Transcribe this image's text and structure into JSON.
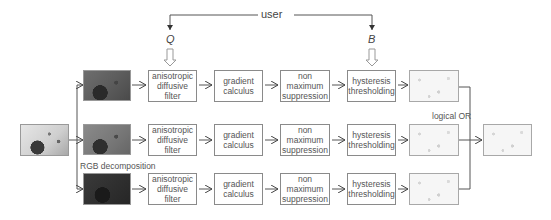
{
  "diagram": {
    "user_label": "user",
    "params": {
      "q": "Q",
      "b": "B"
    },
    "rgb_label": "RGB decomposition",
    "or_label": "logical OR",
    "rows": [
      {
        "channel": "red",
        "steps": [
          "anisotropic\ndiffusive\nfilter",
          "gradient\ncalculus",
          "non\nmaximum\nsuppression",
          "hysteresis\nthresholding"
        ]
      },
      {
        "channel": "green",
        "steps": [
          "anisotropic\ndiffusive\nfilter",
          "gradient\ncalculus",
          "non\nmaximum\nsuppression",
          "hysteresis\nthresholding"
        ]
      },
      {
        "channel": "blue",
        "steps": [
          "anisotropic\ndiffusive\nfilter",
          "gradient\ncalculus",
          "non\nmaximum\nsuppression",
          "hysteresis\nthresholding"
        ]
      }
    ],
    "images": {
      "input": "input-color-image",
      "channels": [
        "red-channel-image",
        "green-channel-image",
        "blue-channel-image"
      ],
      "edge_maps": [
        "red-edge-map",
        "green-edge-map",
        "blue-edge-map"
      ],
      "output": "combined-edge-map"
    }
  }
}
